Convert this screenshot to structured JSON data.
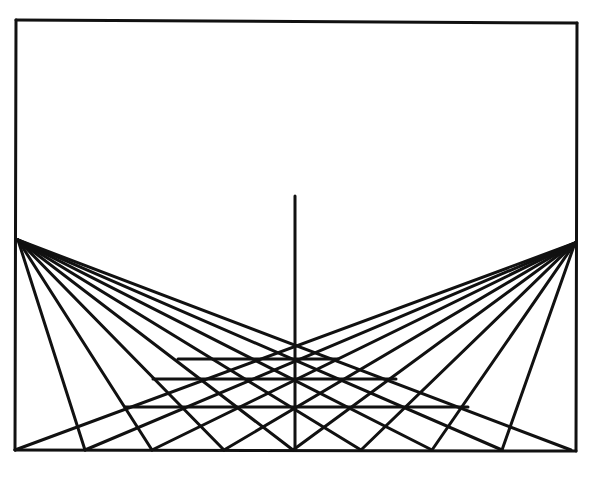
{
  "diagram": {
    "type": "perspective-illusion",
    "ink_color": "#111111",
    "background_color": "#ffffff",
    "stroke_width": 3,
    "frame": {
      "x1": 16,
      "y1": 20,
      "x2": 577,
      "y2": 450,
      "top_right_y": 23
    },
    "vanishing_points": {
      "left": {
        "x": 18,
        "y": 240
      },
      "right": {
        "x": 575,
        "y": 243
      }
    },
    "baseline_y": 450,
    "bottom_points_x": [
      15,
      85,
      152,
      224,
      293,
      361,
      432,
      502,
      571
    ],
    "center_pole": {
      "x": 295,
      "y_top": 196,
      "y_bottom": 450
    },
    "horizontals": [
      {
        "y": 359,
        "x1": 178,
        "x2": 338
      },
      {
        "y": 379,
        "x1": 153,
        "x2": 396
      },
      {
        "y": 407,
        "x1": 125,
        "x2": 468
      }
    ]
  }
}
